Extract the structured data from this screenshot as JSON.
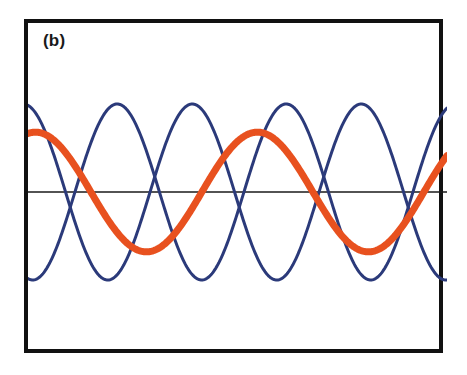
{
  "figure": {
    "panel_label": "(b)",
    "background_color": "#ffffff",
    "frame_color": "#111111",
    "frame_width_px": 4,
    "zero_line_color": "#1a1a1a",
    "zero_line_width_px": 1.6
  },
  "chart_data": {
    "type": "line",
    "title": "(b)",
    "xlabel": "",
    "ylabel": "",
    "xlim": [
      0,
      419
    ],
    "ylim": [
      -1.35,
      1.35
    ],
    "grid": false,
    "legend": "none",
    "axes": {
      "zero_line_y": 0,
      "x_axis_visible": true,
      "y_axis_visible": false,
      "tick_labels_x": [],
      "tick_labels_y": []
    },
    "annotations": [
      {
        "text": "(b)",
        "x": 15,
        "y": 9,
        "role": "panel-label"
      }
    ],
    "series": [
      {
        "name": "navy-wave-1",
        "color": "#2b3a7a",
        "line_width_px": 3.0,
        "waveform": "sine",
        "amplitude": 1.0,
        "period_px": 169,
        "phase_deg": 100,
        "y_offset": 0,
        "x_samples": [
          0,
          21,
          42,
          63,
          84,
          105,
          127,
          148,
          169,
          190,
          211,
          232,
          254,
          275,
          296,
          317,
          338,
          359,
          381,
          402,
          419
        ],
        "y_values": [
          0.17,
          0.74,
          1.0,
          0.8,
          0.26,
          -0.4,
          -0.88,
          -1.0,
          -0.68,
          -0.09,
          0.55,
          0.95,
          0.97,
          0.59,
          -0.02,
          -0.62,
          -0.97,
          -0.93,
          -0.5,
          0.14,
          0.66
        ]
      },
      {
        "name": "navy-wave-2",
        "color": "#2b3a7a",
        "line_width_px": 3.0,
        "waveform": "sine",
        "amplitude": 1.0,
        "period_px": 169,
        "phase_deg": 260,
        "y_offset": 0,
        "x_samples": [
          0,
          21,
          42,
          63,
          84,
          105,
          127,
          148,
          169,
          190,
          211,
          232,
          254,
          275,
          296,
          317,
          338,
          359,
          381,
          402,
          419
        ],
        "y_values": [
          -0.17,
          -0.74,
          -1.0,
          -0.8,
          -0.26,
          0.4,
          0.88,
          1.0,
          0.68,
          0.09,
          -0.55,
          -0.95,
          -0.97,
          -0.59,
          0.02,
          0.62,
          0.97,
          0.93,
          0.5,
          -0.14,
          -0.66
        ]
      },
      {
        "name": "orange-wave",
        "color": "#e8511f",
        "line_width_px": 7.0,
        "waveform": "sine",
        "amplitude": 0.68,
        "period_px": 222,
        "phase_deg": 78,
        "y_offset": 0,
        "x_samples": [
          0,
          22,
          44,
          67,
          89,
          111,
          133,
          155,
          178,
          200,
          222,
          244,
          266,
          289,
          311,
          333,
          355,
          377,
          400,
          419
        ],
        "y_values": [
          0.66,
          0.68,
          0.59,
          0.41,
          0.16,
          -0.12,
          -0.38,
          -0.57,
          -0.67,
          -0.67,
          -0.56,
          -0.36,
          -0.1,
          0.18,
          0.43,
          0.6,
          0.68,
          0.65,
          0.5,
          0.33
        ]
      }
    ]
  }
}
